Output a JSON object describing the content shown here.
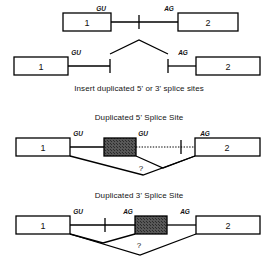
{
  "figure": {
    "type": "diagram",
    "captions": {
      "insert": "Insert duplicated 5' or 3' splice sites",
      "duplicated_5": "Duplicated 5' Splice Site",
      "duplicated_3": "Duplicated 3' Splice Site"
    },
    "labels": {
      "exon1": "1",
      "exon2": "2",
      "donor": "GU",
      "acceptor": "AG",
      "question": "?"
    },
    "colors": {
      "line": "#000000",
      "exon_fill": "#ffffff",
      "insert_fill": "#58585a",
      "text": "#111111"
    },
    "panels": [
      {
        "id": "panel-original",
        "name": "original pre-mRNA",
        "elements": [
          {
            "kind": "exon",
            "label": "1"
          },
          {
            "kind": "site",
            "label": "GU",
            "role": "5-prime-donor"
          },
          {
            "kind": "intron-line",
            "label": ""
          },
          {
            "kind": "branch-tick",
            "label": ""
          },
          {
            "kind": "site",
            "label": "AG",
            "role": "3-prime-acceptor"
          },
          {
            "kind": "exon",
            "label": "2"
          }
        ]
      },
      {
        "id": "panel-split",
        "name": "split intron halves",
        "elements": [
          {
            "kind": "exon",
            "label": "1"
          },
          {
            "kind": "site",
            "label": "GU",
            "role": "5-prime-donor"
          },
          {
            "kind": "intron-line",
            "label": ""
          },
          {
            "kind": "end-tick",
            "label": ""
          },
          {
            "kind": "chevron",
            "label": ""
          },
          {
            "kind": "end-tick",
            "label": ""
          },
          {
            "kind": "site",
            "label": "AG",
            "role": "3-prime-acceptor"
          },
          {
            "kind": "exon",
            "label": "2"
          }
        ]
      },
      {
        "id": "panel-dup5",
        "name": "duplicated 5' splice site construct",
        "elements": [
          {
            "kind": "exon",
            "label": "1"
          },
          {
            "kind": "site",
            "label": "GU",
            "role": "5-prime-donor"
          },
          {
            "kind": "insert-box",
            "label": ""
          },
          {
            "kind": "site",
            "label": "GU",
            "role": "duplicated-5-prime-donor"
          },
          {
            "kind": "dotted-line",
            "label": ""
          },
          {
            "kind": "branch-tick",
            "label": ""
          },
          {
            "kind": "site",
            "label": "AG",
            "role": "3-prime-acceptor"
          },
          {
            "kind": "exon",
            "label": "2"
          },
          {
            "kind": "splice-path",
            "label": "?"
          }
        ]
      },
      {
        "id": "panel-dup3",
        "name": "duplicated 3' splice site construct",
        "elements": [
          {
            "kind": "exon",
            "label": "1"
          },
          {
            "kind": "site",
            "label": "GU",
            "role": "5-prime-donor"
          },
          {
            "kind": "branch-tick",
            "label": ""
          },
          {
            "kind": "site",
            "label": "AG",
            "role": "duplicated-3-prime-acceptor"
          },
          {
            "kind": "insert-box",
            "label": ""
          },
          {
            "kind": "site",
            "label": "AG",
            "role": "3-prime-acceptor"
          },
          {
            "kind": "exon",
            "label": "2"
          },
          {
            "kind": "splice-path",
            "label": "?"
          }
        ]
      }
    ]
  }
}
